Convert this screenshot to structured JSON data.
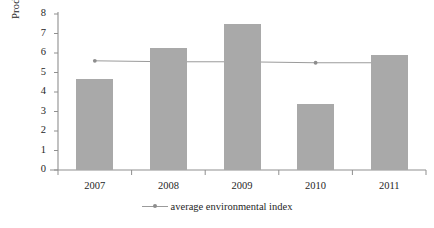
{
  "chart_data": {
    "type": "bar",
    "title": "",
    "subtitle": "",
    "xlabel": "",
    "ylabel": "Productivity, t/ha",
    "categories": [
      "2007",
      "2008",
      "2009",
      "2010",
      "2011"
    ],
    "ylim": [
      0,
      8
    ],
    "ytick_labels": [
      "0",
      "1",
      "2",
      "3",
      "4",
      "5",
      "6",
      "7",
      "8"
    ],
    "ytick_values": [
      0,
      1,
      2,
      3,
      4,
      5,
      6,
      7,
      8
    ],
    "grid": false,
    "legend_position": "bottom-center",
    "series": [
      {
        "name": "productivity",
        "type": "bar",
        "color": "#a9a9a9",
        "show_in_legend": false,
        "values": [
          4.65,
          6.25,
          7.5,
          3.4,
          5.9
        ]
      },
      {
        "name": "average environmental index",
        "type": "line",
        "color": "#9b9b9b",
        "marker": "dot",
        "show_in_legend": true,
        "values": [
          5.6,
          5.55,
          5.55,
          5.5,
          5.5
        ]
      }
    ]
  },
  "legend": {
    "entries": [
      {
        "label": "average environmental index",
        "glyph": "line-with-dot-marker"
      }
    ]
  },
  "axes": {
    "y_title": "Productivity, t/ha"
  },
  "colors": {
    "bar_fill": "#a9a9a9",
    "line": "#9b9b9b",
    "axis": "#8f8f8f",
    "text": "#262626",
    "background": "#ffffff"
  }
}
